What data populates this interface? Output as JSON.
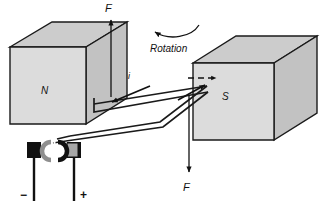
{
  "figure": {
    "type": "physics-diagram",
    "background_color": "#ffffff"
  },
  "labels": {
    "force_top": "F",
    "force_bottom": "F",
    "current": "i",
    "north_pole": "N",
    "south_pole": "S",
    "rotation": "Rotation",
    "terminal_negative": "−",
    "terminal_positive": "+"
  },
  "blocks": [
    {
      "name": "north-magnet-block",
      "label": "N",
      "face_color": "#d9d9d9",
      "top_color": "#cccccc",
      "side_color": "#c2c2c2",
      "stroke": "#1a1a1a"
    },
    {
      "name": "south-magnet-block",
      "label": "S",
      "face_color": "#d9d9d9",
      "top_color": "#cccccc",
      "side_color": "#c2c2c2",
      "stroke": "#1a1a1a"
    }
  ],
  "commutator": {
    "name": "split-ring-commutator",
    "segment_color": "#a6a6a6",
    "brush_color": "#111111",
    "brush_left_name": "brush-negative",
    "brush_right_name": "brush-positive"
  },
  "arrows": {
    "force_top_direction": "up",
    "force_bottom_direction": "down",
    "current_direction": "down-left",
    "rotation_direction": "clockwise",
    "field_direction": "left-to-right"
  },
  "colors": {
    "line": "#1a1a1a",
    "metal_fill": "#d9d9d9",
    "dark_fill": "#111111"
  }
}
